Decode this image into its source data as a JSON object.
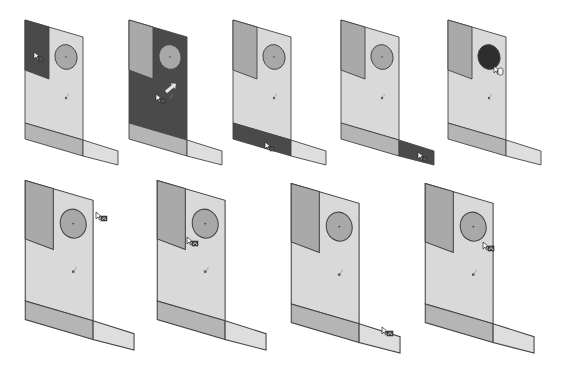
{
  "figure": {
    "colors": {
      "face_normal": "#d9d9d9",
      "face_side": "#a9a9a9",
      "face_strip": "#b5b5b5",
      "face_flange": "#dedede",
      "face_selected": "#4a4a4a",
      "hole_fill": "#a8a8a8",
      "hole_selected": "#2e2e2e",
      "edge": "#3a3a3a",
      "background": "#ffffff"
    },
    "panels": [
      {
        "id": 1,
        "row": 1,
        "ox": 0,
        "oy": 0,
        "selected": "top-left-face",
        "cursor": {
          "x": 34,
          "y": 52,
          "type": "select-face"
        }
      },
      {
        "id": 2,
        "row": 1,
        "ox": 104,
        "oy": 0,
        "selected": "main-face",
        "cursor": {
          "x": 156,
          "y": 94,
          "type": "select-face"
        }
      },
      {
        "id": 3,
        "row": 1,
        "ox": 208,
        "oy": 0,
        "selected": "bottom-strip",
        "cursor": {
          "x": 265,
          "y": 142,
          "type": "select-face"
        }
      },
      {
        "id": 4,
        "row": 1,
        "ox": 316,
        "oy": 0,
        "selected": "flange",
        "cursor": {
          "x": 418,
          "y": 152,
          "type": "select-face"
        }
      },
      {
        "id": 5,
        "row": 1,
        "ox": 423,
        "oy": 0,
        "selected": "hole",
        "cursor": {
          "x": 494,
          "y": 66,
          "type": "select-hole"
        }
      },
      {
        "id": 6,
        "row": 2,
        "ox": 0,
        "oy": 157,
        "selected": "none",
        "cursor": {
          "x": 96,
          "y": 212,
          "type": "select-edge"
        }
      },
      {
        "id": 7,
        "row": 2,
        "ox": 132,
        "oy": 157,
        "selected": "none",
        "cursor": {
          "x": 187,
          "y": 237,
          "type": "select-edge"
        }
      },
      {
        "id": 8,
        "row": 2,
        "ox": 266,
        "oy": 160,
        "selected": "none",
        "cursor": {
          "x": 382,
          "y": 327,
          "type": "select-edge"
        }
      },
      {
        "id": 9,
        "row": 2,
        "ox": 400,
        "oy": 160,
        "selected": "none",
        "cursor": {
          "x": 483,
          "y": 242,
          "type": "select-edge"
        }
      }
    ]
  }
}
